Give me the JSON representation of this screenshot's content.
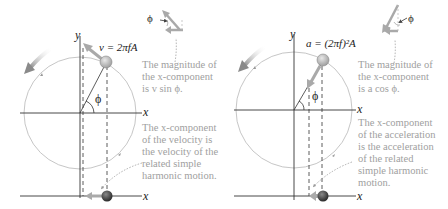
{
  "left_panel": {
    "y_axis_label": "y",
    "x_axis_label": "x",
    "bottom_axis_label": "x",
    "angle_label": "ϕ",
    "vector_equation": "v = 2πfA",
    "inset_angle_label": "ϕ",
    "caption_top": "The magnitude of\nthe x-component\nis v sin ϕ.",
    "caption_bottom": "The x-component\nof the velocity is\nthe velocity of the\nrelated simple\nharmonic motion."
  },
  "right_panel": {
    "y_axis_label": "y",
    "x_axis_label": "x",
    "bottom_axis_label": "x",
    "angle_label": "ϕ",
    "vector_equation": "a = (2πf)²A",
    "inset_angle_label": "ϕ",
    "caption_top": "The magnitude of\nthe x-component\nis a cos ϕ.",
    "caption_bottom": "The x-component\nof the acceleration\nis the acceleration\nof the related\nsimple harmonic\nmotion."
  },
  "colors": {
    "axis": "#333333",
    "circle": "#b8b8b8",
    "vector": "#a9a9a9",
    "caption": "#a0a0a0",
    "ball": "#c8c8c8",
    "bottom_ball": "#444444"
  }
}
